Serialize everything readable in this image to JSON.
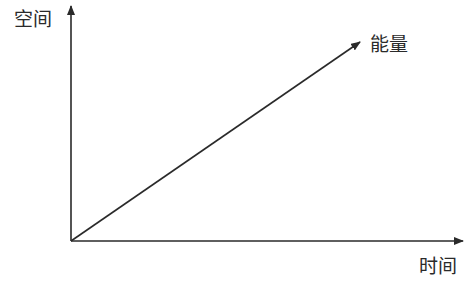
{
  "diagram": {
    "axes": {
      "y_label": "空间",
      "x_label": "时间"
    },
    "vector": {
      "label": "能量"
    },
    "colors": {
      "line": "#2a2a2a",
      "background": "#ffffff"
    }
  }
}
